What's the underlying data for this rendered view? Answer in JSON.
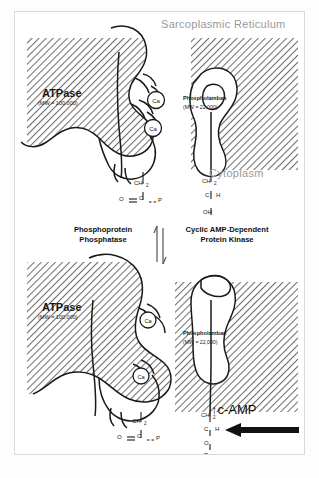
{
  "figure": {
    "compartments": {
      "sr_label": "Sarcoplasmic Reticulum",
      "cytoplasm_label": "Cytoplasm"
    },
    "colors": {
      "membrane_hatch": "#6e6e6e",
      "outline": "#1a1a1a",
      "label_gray": "#9a9a9a",
      "text_black": "#111111",
      "frame": "#d8d8d8",
      "page_background": "#fdfdfd",
      "panel_background": "#ffffff"
    }
  },
  "panels": [
    {
      "id": "top",
      "state": "dephosphorylated-phospholamban",
      "proteins": [
        {
          "name": "ATPase",
          "mw_label": "(MW = 100,000)",
          "mw_value": 100000
        },
        {
          "name": "Phospholamban",
          "mw_label": "(MW = 22,000)",
          "mw_value": 22000
        }
      ],
      "ions": [
        {
          "label": "Ca",
          "charge": "++"
        },
        {
          "label": "Ca",
          "charge": "++"
        }
      ],
      "ion_count": 2,
      "residues": [
        {
          "owner": "ATPase",
          "state": "phosphorylated",
          "atoms": [
            "CH",
            "2",
            "C",
            "O",
            "P"
          ],
          "ch2": "CH",
          "ch2_sub": "2",
          "carbon": "C",
          "oxygen": "O",
          "phosphate": "P"
        },
        {
          "owner": "Phospholamban",
          "state": "unphosphorylated",
          "ch2": "CH",
          "ch2_sub": "2",
          "carbon": "C",
          "hydrogen": "H",
          "hydroxyl": "OH"
        }
      ]
    },
    {
      "id": "bottom",
      "state": "phosphorylated-phospholamban",
      "proteins": [
        {
          "name": "ATPase",
          "mw_label": "(MW = 100,000)",
          "mw_value": 100000
        },
        {
          "name": "Phospholamban",
          "mw_label": "(MW = 22,000)",
          "mw_value": 22000
        }
      ],
      "ions": [
        {
          "label": "Ca",
          "charge": "++"
        },
        {
          "label": "Ca",
          "charge": "++"
        }
      ],
      "ion_count": 2,
      "residues": [
        {
          "owner": "ATPase",
          "state": "phosphorylated",
          "ch2": "CH",
          "ch2_sub": "2",
          "carbon": "C",
          "oxygen": "O",
          "phosphate": "P"
        },
        {
          "owner": "Phospholamban",
          "state": "phosphorylated",
          "ch2": "CH",
          "ch2_sub": "2",
          "carbon": "C",
          "hydrogen": "H",
          "oxygen": "O",
          "phosphate": "P"
        }
      ]
    }
  ],
  "reaction": {
    "reverse_enzyme_line1": "Phosphoprotein",
    "reverse_enzyme_line2": "Phosphatase",
    "forward_enzyme_line1": "Cyclic AMP-Dependent",
    "forward_enzyme_line2": "Protein Kinase",
    "arrow_type": "equilibrium-double-arrow"
  },
  "stimulus": {
    "arrow": "↑",
    "label": "c-AMP",
    "direction": "leftward"
  }
}
